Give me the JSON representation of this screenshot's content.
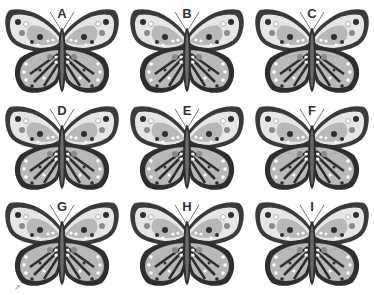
{
  "puzzle": {
    "butterflies": [
      {
        "label": "A"
      },
      {
        "label": "B"
      },
      {
        "label": "C"
      },
      {
        "label": "D"
      },
      {
        "label": "E"
      },
      {
        "label": "F"
      },
      {
        "label": "G"
      },
      {
        "label": "H"
      },
      {
        "label": "I"
      }
    ],
    "colors": {
      "outline": "#3a3a3a",
      "wing_light": "#e6e6e6",
      "wing_mid": "#b8b8b8",
      "dark": "#2e2e2e",
      "spot_gray": "#8a8a8a"
    },
    "corner_mark": "↗"
  }
}
